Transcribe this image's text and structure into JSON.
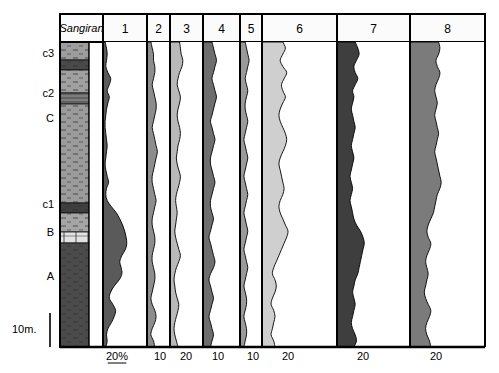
{
  "figure": {
    "type": "stratigraphic-percentage-diagram",
    "background_color": "#ffffff",
    "frame_color": "#000000"
  },
  "lithology_column": {
    "header_label": "Sangiran",
    "x_left": 60,
    "x_right": 103,
    "y_top": 42,
    "y_bottom": 347,
    "units": [
      {
        "name": "unit-top-light",
        "y0": 42,
        "y1": 60,
        "fill": "#9d9d9d",
        "pattern": "sandy"
      },
      {
        "name": "unit-c3-dark",
        "y0": 60,
        "y1": 70,
        "fill": "#4a4a4a",
        "pattern": "dense"
      },
      {
        "name": "unit-mid-a",
        "y0": 70,
        "y1": 93,
        "fill": "#a0a0a0",
        "pattern": "silt"
      },
      {
        "name": "unit-c2-band",
        "y0": 93,
        "y1": 104,
        "fill": "#7d7d7d",
        "pattern": "laminated"
      },
      {
        "name": "unit-C-main",
        "y0": 104,
        "y1": 203,
        "fill": "#9b9b9b",
        "pattern": "silt"
      },
      {
        "name": "unit-c1-dark",
        "y0": 203,
        "y1": 213,
        "fill": "#3f3f3f",
        "pattern": "dense"
      },
      {
        "name": "unit-below-c1",
        "y0": 213,
        "y1": 232,
        "fill": "#a5a5a5",
        "pattern": "silt"
      },
      {
        "name": "unit-B-band",
        "y0": 232,
        "y1": 243,
        "fill": "#e2e2e2",
        "pattern": "blocky"
      },
      {
        "name": "unit-A-main",
        "y0": 243,
        "y1": 347,
        "fill": "#4b4b4b",
        "pattern": "clay"
      }
    ]
  },
  "depth_labels": [
    {
      "text": "c3",
      "y": 57
    },
    {
      "text": "c2",
      "y": 97
    },
    {
      "text": "C",
      "y": 122
    },
    {
      "text": "c1",
      "y": 208
    },
    {
      "text": "B",
      "y": 236
    },
    {
      "text": "A",
      "y": 280
    }
  ],
  "scale_bar": {
    "label": "10m.",
    "label_x": 12,
    "label_y": 333,
    "line_x": 50,
    "y_top": 313,
    "y_bottom": 347
  },
  "columns": [
    {
      "id": 1,
      "header": "1",
      "axis_label": "20%",
      "axis_label_underlined": true,
      "x_left": 103,
      "x_right": 147,
      "baseline_x": 103,
      "tick_x": 117,
      "fill": "#5a5a5a",
      "stroke": "#000000",
      "full_scale_pct": 20,
      "values": [
        3,
        5,
        6,
        5,
        4,
        7,
        11,
        9,
        6,
        9,
        7,
        5,
        4,
        3,
        3,
        4,
        5,
        6,
        5,
        4,
        3,
        4,
        6,
        8,
        5,
        4,
        6,
        12,
        19,
        24,
        28,
        31,
        33,
        34,
        32,
        27,
        24,
        26,
        27,
        23,
        16,
        11,
        9,
        14,
        18,
        16,
        12,
        7,
        5,
        6,
        4
      ]
    },
    {
      "id": 2,
      "header": "2",
      "axis_label": "10",
      "x_left": 147,
      "x_right": 170,
      "baseline_x": 147,
      "tick_x": 160,
      "fill": "#8d8d8d",
      "stroke": "#000000",
      "full_scale_pct": 10,
      "values": [
        3,
        4,
        5,
        5,
        6,
        6,
        5,
        4,
        5,
        6,
        7,
        7,
        6,
        5,
        4,
        5,
        6,
        7,
        8,
        7,
        6,
        5,
        4,
        4,
        5,
        6,
        7,
        6,
        5,
        4,
        4,
        5,
        6,
        6,
        5,
        4,
        4,
        5,
        6,
        6,
        5,
        4,
        3,
        4,
        6,
        7,
        6,
        4,
        3,
        5,
        6
      ]
    },
    {
      "id": 3,
      "header": "3",
      "axis_label": "20",
      "x_left": 170,
      "x_right": 203,
      "baseline_x": 170,
      "tick_x": 186,
      "fill": "#b9b9b9",
      "stroke": "#000000",
      "full_scale_pct": 20,
      "values": [
        12,
        13,
        14,
        16,
        15,
        12,
        10,
        9,
        11,
        13,
        12,
        10,
        9,
        10,
        12,
        13,
        12,
        10,
        9,
        8,
        9,
        11,
        13,
        12,
        10,
        8,
        7,
        8,
        9,
        8,
        7,
        6,
        7,
        9,
        11,
        13,
        11,
        8,
        6,
        5,
        6,
        7,
        9,
        11,
        10,
        8,
        6,
        5,
        6,
        8,
        10
      ]
    },
    {
      "id": 4,
      "header": "4",
      "axis_label": "10",
      "x_left": 203,
      "x_right": 240,
      "baseline_x": 203,
      "tick_x": 218,
      "fill": "#6e6e6e",
      "stroke": "#000000",
      "full_scale_pct": 10,
      "values": [
        6,
        7,
        8,
        9,
        8,
        7,
        6,
        7,
        8,
        9,
        8,
        7,
        6,
        5,
        6,
        7,
        8,
        7,
        6,
        5,
        5,
        6,
        7,
        8,
        7,
        6,
        5,
        5,
        6,
        7,
        6,
        5,
        4,
        5,
        6,
        7,
        8,
        7,
        5,
        4,
        5,
        6,
        7,
        6,
        5,
        4,
        5,
        6,
        7,
        6,
        5
      ]
    },
    {
      "id": 5,
      "header": "5",
      "axis_label": "10",
      "x_left": 240,
      "x_right": 262,
      "baseline_x": 240,
      "tick_x": 253,
      "fill": "#9a9a9a",
      "stroke": "#000000",
      "full_scale_pct": 10,
      "values": [
        4,
        5,
        6,
        7,
        6,
        5,
        4,
        5,
        6,
        5,
        4,
        4,
        5,
        6,
        5,
        4,
        3,
        4,
        5,
        6,
        5,
        4,
        3,
        4,
        5,
        6,
        5,
        4,
        3,
        4,
        5,
        6,
        5,
        4,
        3,
        4,
        5,
        6,
        5,
        4,
        3,
        4,
        5,
        5,
        4,
        3,
        4,
        5,
        5,
        4,
        3
      ]
    },
    {
      "id": 6,
      "header": "6",
      "axis_label": "20",
      "x_left": 262,
      "x_right": 337,
      "baseline_x": 262,
      "tick_x": 288,
      "fill": "#cfcfcf",
      "stroke": "#000000",
      "full_scale_pct": 20,
      "values": [
        16,
        18,
        16,
        14,
        16,
        19,
        17,
        15,
        16,
        18,
        16,
        14,
        13,
        14,
        16,
        18,
        19,
        18,
        16,
        14,
        13,
        14,
        15,
        16,
        17,
        16,
        14,
        13,
        14,
        16,
        18,
        20,
        19,
        17,
        15,
        13,
        11,
        9,
        8,
        10,
        11,
        10,
        8,
        7,
        9,
        10,
        9,
        8,
        7,
        9,
        10
      ]
    },
    {
      "id": 7,
      "header": "7",
      "axis_label": "20",
      "x_left": 337,
      "x_right": 410,
      "baseline_x": 337,
      "tick_x": 363,
      "fill": "#3e3e3e",
      "stroke": "#000000",
      "full_scale_pct": 20,
      "values": [
        14,
        16,
        17,
        15,
        13,
        14,
        16,
        14,
        12,
        13,
        12,
        11,
        12,
        13,
        14,
        13,
        12,
        11,
        12,
        13,
        12,
        11,
        10,
        11,
        12,
        11,
        10,
        11,
        12,
        13,
        15,
        18,
        20,
        21,
        20,
        19,
        18,
        17,
        16,
        14,
        13,
        12,
        13,
        14,
        13,
        12,
        11,
        12,
        14,
        15,
        13
      ]
    },
    {
      "id": 8,
      "header": "8",
      "axis_label": "20",
      "x_left": 410,
      "x_right": 485,
      "baseline_x": 410,
      "tick_x": 436,
      "fill": "#7b7b7b",
      "stroke": "#000000",
      "full_scale_pct": 20,
      "values": [
        22,
        23,
        22,
        20,
        21,
        23,
        22,
        20,
        19,
        20,
        21,
        20,
        19,
        20,
        21,
        22,
        21,
        20,
        19,
        20,
        21,
        22,
        23,
        24,
        23,
        21,
        20,
        19,
        18,
        16,
        14,
        13,
        14,
        16,
        15,
        13,
        12,
        13,
        14,
        13,
        12,
        11,
        12,
        14,
        16,
        15,
        13,
        12,
        13,
        15,
        16
      ]
    }
  ],
  "header_row": {
    "y_top": 14,
    "y_bottom": 42
  },
  "axis_row": {
    "y": 347,
    "label_y": 360
  },
  "chart_data": {
    "type": "area",
    "title": "",
    "xlabel": "Percentage",
    "ylabel": "Stratigraphic depth",
    "grid": false,
    "legend": "none",
    "orientation": "vertical-depth",
    "series": [
      {
        "name": "1",
        "scale": "20%",
        "color": "#5a5a5a"
      },
      {
        "name": "2",
        "scale": "10",
        "color": "#8d8d8d"
      },
      {
        "name": "3",
        "scale": "20",
        "color": "#b9b9b9"
      },
      {
        "name": "4",
        "scale": "10",
        "color": "#6e6e6e"
      },
      {
        "name": "5",
        "scale": "10",
        "color": "#9a9a9a"
      },
      {
        "name": "6",
        "scale": "20",
        "color": "#cfcfcf"
      },
      {
        "name": "7",
        "scale": "20",
        "color": "#3e3e3e"
      },
      {
        "name": "8",
        "scale": "20",
        "color": "#7b7b7b"
      }
    ]
  }
}
